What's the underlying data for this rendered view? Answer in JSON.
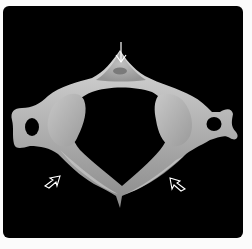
{
  "figure": {
    "background_color": "#000000",
    "bone_color": "#b5b5b5",
    "arrow_color": "#ffffff",
    "annotations": [
      {
        "id": "arrow-top",
        "type": "solid-arrow",
        "direction": "down",
        "target": "posterior tubercle"
      },
      {
        "id": "arrow-left",
        "type": "open-arrowhead",
        "direction": "up-right",
        "target": "left anterior arch"
      },
      {
        "id": "arrow-right",
        "type": "open-arrowhead",
        "direction": "up-left",
        "target": "right anterior arch"
      }
    ]
  }
}
